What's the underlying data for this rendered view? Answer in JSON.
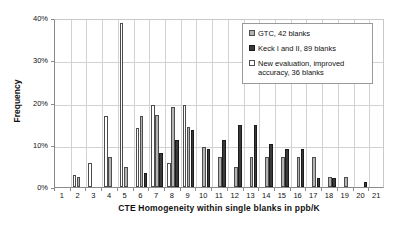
{
  "chart_data": {
    "type": "bar",
    "title": "",
    "xlabel": "CTE Homogeneity within single blanks in ppb/K",
    "ylabel": "Frequency",
    "categories": [
      "1",
      "2",
      "3",
      "4",
      "5",
      "6",
      "7",
      "8",
      "9",
      "10",
      "11",
      "12",
      "13",
      "14",
      "15",
      "16",
      "17",
      "18",
      "19",
      "20",
      "21"
    ],
    "ylim": [
      0,
      40
    ],
    "ytick_labels": [
      "0%",
      "10%",
      "20%",
      "30%",
      "40%"
    ],
    "ytick_values": [
      0,
      10,
      20,
      30,
      40
    ],
    "yaxis_unit": "%",
    "grid": "horizontal-and-vertical",
    "legend_position": "top-right-inside",
    "series": [
      {
        "name": "GTC, 42 blanks",
        "color": "#b3b3b3",
        "values": [
          0,
          2.4,
          0,
          7.2,
          4.8,
          16.7,
          17.0,
          19.0,
          14.3,
          9.5,
          7.1,
          4.8,
          7.1,
          7.1,
          7.1,
          7.1,
          7.1,
          2.4,
          2.4,
          0,
          0
        ]
      },
      {
        "name": "Keck I and II, 89 blanks",
        "color": "#3a3a3a",
        "values": [
          0,
          0,
          0,
          0,
          0,
          3.4,
          8.0,
          11.2,
          13.5,
          9.0,
          11.2,
          14.6,
          14.6,
          10.1,
          9.0,
          9.0,
          2.2,
          2.2,
          0,
          1.1,
          0
        ]
      },
      {
        "name": "New evaluation, improved accuracy, 36 blanks",
        "color": "#ffffff",
        "values": [
          0,
          2.8,
          5.6,
          16.7,
          38.9,
          13.9,
          19.4,
          5.6,
          19.4,
          0,
          0,
          0,
          0,
          0,
          0,
          0,
          0,
          0,
          0,
          0,
          0
        ]
      }
    ]
  },
  "legend": {
    "items": [
      {
        "label": "GTC, 42 blanks",
        "swatch": "gtc-swatch"
      },
      {
        "label": "Keck I and II, 89 blanks",
        "swatch": "keck-swatch"
      },
      {
        "label": "New evaluation, improved accuracy, 36 blanks",
        "swatch": "new-evaluation-swatch"
      }
    ]
  }
}
